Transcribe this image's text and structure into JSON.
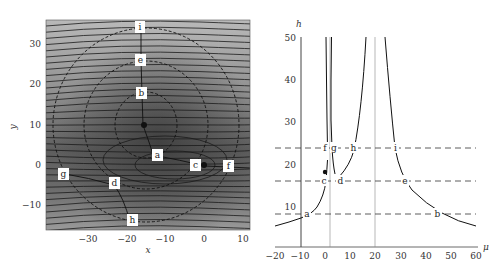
{
  "chart_data": [
    {
      "type": "contour",
      "title": "",
      "xlabel": "x",
      "ylabel": "y",
      "xlim": [
        -40,
        12
      ],
      "ylim": [
        -16,
        35
      ],
      "xticks": [
        -30,
        -20,
        -10,
        0,
        10
      ],
      "yticks": [
        -10,
        0,
        10,
        20,
        30
      ],
      "grid": false,
      "minima": [
        {
          "x": -15,
          "y": 10
        },
        {
          "x": 0,
          "y": 0
        }
      ],
      "labeled_points": [
        {
          "label": "i",
          "x": -16,
          "y": 34
        },
        {
          "label": "e",
          "x": -16,
          "y": 25
        },
        {
          "label": "b",
          "x": -15,
          "y": 17
        },
        {
          "label": "a",
          "x": -12,
          "y": 2.5
        },
        {
          "label": "c",
          "x": -2,
          "y": 0
        },
        {
          "label": "f",
          "x": 6,
          "y": -0.5
        },
        {
          "label": "g",
          "x": -35,
          "y": -2.5
        },
        {
          "label": "d",
          "x": -22,
          "y": -4.5
        },
        {
          "label": "h",
          "x": -18,
          "y": -14
        }
      ],
      "dashed_circles": [
        {
          "center": [
            -15,
            10
          ],
          "radius": 8
        },
        {
          "center": [
            -15,
            10
          ],
          "radius": 16
        },
        {
          "center": [
            -15,
            10
          ],
          "radius": 24
        }
      ]
    },
    {
      "type": "line",
      "title": "",
      "xlabel": "μ",
      "ylabel": "h",
      "xlim": [
        -20,
        60
      ],
      "ylim": [
        0,
        50
      ],
      "xticks": [
        -20,
        -10,
        0,
        10,
        20,
        30,
        40,
        50,
        60
      ],
      "yticks": [
        10,
        20,
        30,
        40,
        50
      ],
      "grid": false,
      "vertical_lines": [
        -10,
        2,
        20
      ],
      "horizontal_dashed_lines": [
        8,
        16,
        24
      ],
      "series": [
        {
          "name": "branch-left",
          "x": [
            -20,
            -15,
            -10,
            -8,
            -5,
            -3,
            -1,
            0.5,
            1
          ],
          "y": [
            5.2,
            6.2,
            7.4,
            8,
            10,
            12.5,
            16,
            20,
            24
          ]
        },
        {
          "name": "branch-inner-left",
          "x": [
            0.8,
            1.2,
            1.5,
            1.7
          ],
          "y": [
            24,
            30,
            40,
            50
          ]
        },
        {
          "name": "branch-inner-right",
          "x": [
            4.5,
            3.5,
            2.8,
            2.3
          ],
          "y": [
            17,
            24,
            35,
            50
          ]
        },
        {
          "name": "branch-mid",
          "x": [
            5,
            8,
            11,
            13,
            15,
            16.5
          ],
          "y": [
            17,
            20,
            24,
            30,
            40,
            50
          ]
        },
        {
          "name": "branch-right",
          "x": [
            24,
            26,
            28,
            32,
            36,
            45,
            60
          ],
          "y": [
            50,
            35,
            24,
            16,
            12,
            8,
            5
          ]
        }
      ],
      "marked_point": {
        "x": 0,
        "y": 18
      },
      "labeled_points": [
        {
          "label": "f",
          "x": 0,
          "y": 24
        },
        {
          "label": "g",
          "x": 3,
          "y": 24
        },
        {
          "label": "h",
          "x": 11,
          "y": 24
        },
        {
          "label": "i",
          "x": 28,
          "y": 24
        },
        {
          "label": "c",
          "x": -1,
          "y": 16
        },
        {
          "label": "d",
          "x": 6,
          "y": 16
        },
        {
          "label": "e",
          "x": 32,
          "y": 16
        },
        {
          "label": "a",
          "x": -8,
          "y": 8
        },
        {
          "label": "b",
          "x": 44,
          "y": 8
        }
      ]
    }
  ],
  "left": {
    "xlabel": "x",
    "ylabel": "y",
    "xticks": [
      "−30",
      "−20",
      "−10",
      "0",
      "10"
    ],
    "yticks": [
      "30",
      "20",
      "10",
      "0",
      "−10"
    ],
    "labels": [
      "i",
      "e",
      "b",
      "a",
      "c",
      "f",
      "g",
      "d",
      "h"
    ]
  },
  "right": {
    "xlabel": "μ",
    "ylabel": "h",
    "xticks": [
      "−20",
      "−10",
      "0",
      "10",
      "20",
      "30",
      "40",
      "50",
      "60"
    ],
    "yticks": [
      "50",
      "40",
      "30",
      "20",
      "10"
    ],
    "labels": [
      "f",
      "g",
      "h",
      "i",
      "c",
      "d",
      "e",
      "a",
      "b"
    ]
  }
}
